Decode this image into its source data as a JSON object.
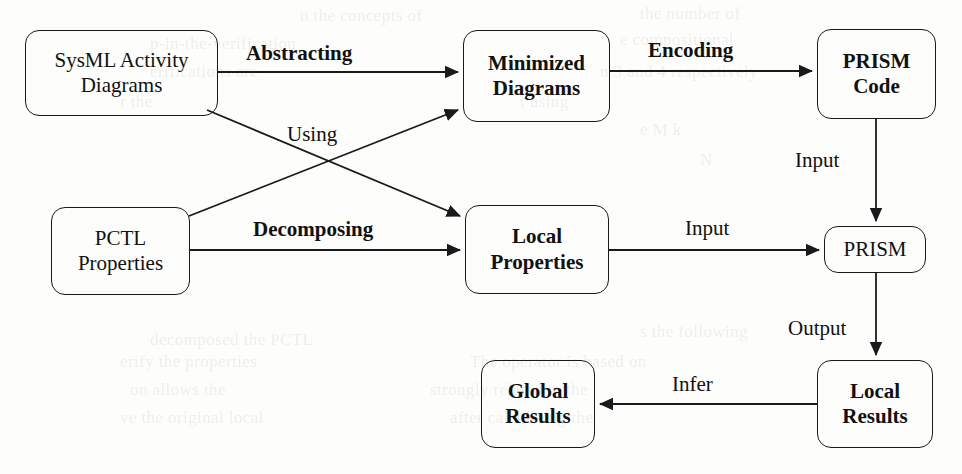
{
  "figure": {
    "type": "flow-diagram",
    "width": 962,
    "height": 474,
    "background_color": "#fdfdfb",
    "stroke_color": "#1a1a1a"
  },
  "nodes": [
    {
      "id": "sysml",
      "label": "SysML Activity\nDiagrams",
      "bold": false,
      "x": 25,
      "y": 30,
      "w": 193,
      "h": 86,
      "font_size": 21
    },
    {
      "id": "pctl",
      "label": "PCTL\nProperties",
      "bold": false,
      "x": 51,
      "y": 207,
      "w": 139,
      "h": 88,
      "font_size": 21
    },
    {
      "id": "minimized",
      "label": "Minimized\nDiagrams",
      "bold": true,
      "x": 463,
      "y": 30,
      "w": 147,
      "h": 92,
      "font_size": 21
    },
    {
      "id": "local_props",
      "label": "Local\nProperties",
      "bold": true,
      "x": 465,
      "y": 205,
      "w": 144,
      "h": 89,
      "font_size": 21
    },
    {
      "id": "prism_code",
      "label": "PRISM\nCode",
      "bold": true,
      "x": 817,
      "y": 29,
      "w": 119,
      "h": 90,
      "font_size": 21
    },
    {
      "id": "prism",
      "label": "PRISM",
      "bold": false,
      "x": 824,
      "y": 226,
      "w": 102,
      "h": 47,
      "font_size": 21
    },
    {
      "id": "local_results",
      "label": "Local\nResults",
      "bold": true,
      "x": 817,
      "y": 360,
      "w": 116,
      "h": 88,
      "font_size": 21
    },
    {
      "id": "global_results",
      "label": "Global\nResults",
      "bold": true,
      "x": 481,
      "y": 360,
      "w": 114,
      "h": 88,
      "font_size": 21
    }
  ],
  "edges": [
    {
      "id": "abstracting",
      "from": "sysml",
      "to": "minimized",
      "label": "Abstracting",
      "bold": true,
      "label_x": 246,
      "label_y": 41,
      "font_size": 21
    },
    {
      "id": "using",
      "from": "sysml",
      "to": "local_props",
      "label": "Using",
      "bold": false,
      "label_x": 287,
      "label_y": 122,
      "font_size": 21
    },
    {
      "id": "decomposing",
      "from": "pctl",
      "to": "local_props",
      "label": "Decomposing",
      "bold": true,
      "label_x": 253,
      "label_y": 217,
      "font_size": 21
    },
    {
      "id": "pctl_to_min",
      "from": "pctl",
      "to": "minimized",
      "label": "",
      "bold": false,
      "label_x": 0,
      "label_y": 0,
      "font_size": 21
    },
    {
      "id": "encoding",
      "from": "minimized",
      "to": "prism_code",
      "label": "Encoding",
      "bold": true,
      "label_x": 648,
      "label_y": 38,
      "font_size": 21
    },
    {
      "id": "input_code",
      "from": "prism_code",
      "to": "prism",
      "label": "Input",
      "bold": false,
      "label_x": 795,
      "label_y": 148,
      "font_size": 21
    },
    {
      "id": "input_props",
      "from": "local_props",
      "to": "prism",
      "label": "Input",
      "bold": false,
      "label_x": 685,
      "label_y": 216,
      "font_size": 21
    },
    {
      "id": "output",
      "from": "prism",
      "to": "local_results",
      "label": "Output",
      "bold": false,
      "label_x": 788,
      "label_y": 316,
      "font_size": 21
    },
    {
      "id": "infer",
      "from": "local_results",
      "to": "global_results",
      "label": "Infer",
      "bold": false,
      "label_x": 672,
      "label_y": 372,
      "font_size": 21
    }
  ],
  "background_text": [
    {
      "text": "n the concepts of",
      "x": 300,
      "y": 6
    },
    {
      "text": "the number of",
      "x": 640,
      "y": 4
    },
    {
      "text": "p-in-the-verification",
      "x": 150,
      "y": 34
    },
    {
      "text": "e compositional",
      "x": 620,
      "y": 30
    },
    {
      "text": "erifications are",
      "x": 150,
      "y": 62
    },
    {
      "text": "n 3 and 4 respectively",
      "x": 600,
      "y": 62
    },
    {
      "text": "r the",
      "x": 120,
      "y": 92
    },
    {
      "text": "t using",
      "x": 520,
      "y": 92
    },
    {
      "text": "e   M  k",
      "x": 640,
      "y": 120
    },
    {
      "text": "N",
      "x": 700,
      "y": 150
    },
    {
      "text": "decomposed the PCTL",
      "x": 150,
      "y": 330
    },
    {
      "text": "s the following",
      "x": 640,
      "y": 322
    },
    {
      "text": "erify the properties",
      "x": 120,
      "y": 352
    },
    {
      "text": "The operator is based on",
      "x": 470,
      "y": 352
    },
    {
      "text": "on allows the",
      "x": 130,
      "y": 380
    },
    {
      "text": "strongly related to the",
      "x": 430,
      "y": 380
    },
    {
      "text": "ve the original local",
      "x": 120,
      "y": 408
    },
    {
      "text": "after calculating the",
      "x": 450,
      "y": 408
    }
  ]
}
